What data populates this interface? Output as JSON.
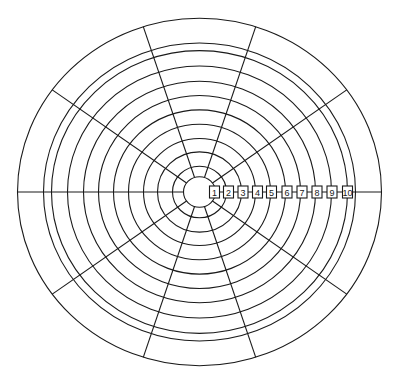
{
  "diagram": {
    "type": "radial-wheel-chart",
    "center": {
      "x": 199.5,
      "y": 192
    },
    "vertical_scale": 0.955,
    "outer_ring_radius": 182,
    "extra_ring_radius": 156,
    "center_circle_radius": 16,
    "scale_ring_radii": [
      27,
      42,
      56,
      71,
      86,
      101,
      116,
      132,
      148
    ],
    "spoke_count": 10,
    "spoke_start_angle_deg": 0,
    "scale_labels": [
      "1",
      "2",
      "3",
      "4",
      "5",
      "6",
      "7",
      "8",
      "9",
      "10"
    ],
    "scale_label_centers_x": [
      214.5,
      228.5,
      243,
      257.5,
      271.5,
      287,
      302,
      317,
      332,
      347.5
    ],
    "stroke_color": "#1a1a1a",
    "background_color": "#ffffff"
  }
}
